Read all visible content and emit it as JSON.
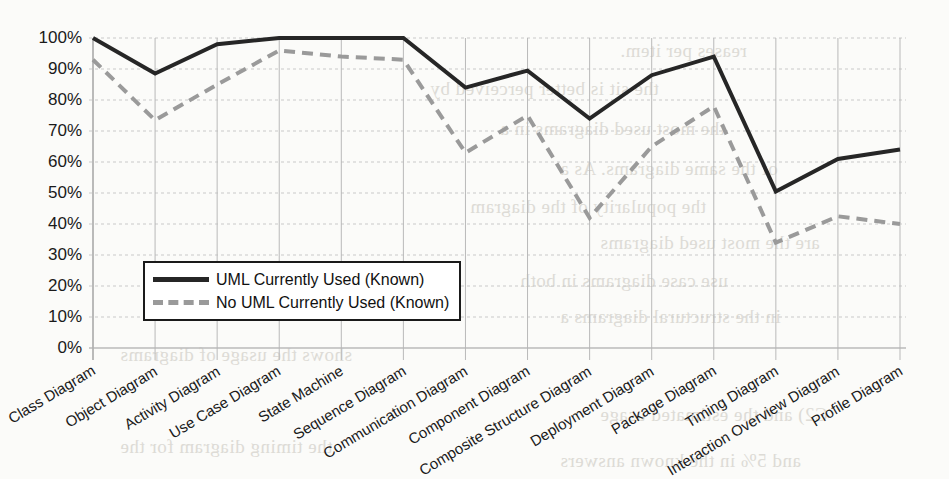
{
  "chart_data": {
    "type": "line",
    "title": "",
    "xlabel": "",
    "ylabel": "",
    "ylim": [
      0,
      100
    ],
    "grid": true,
    "legend_position": "inside-lower-left",
    "ytick_labels": [
      "100%",
      "90%",
      "80%",
      "70%",
      "60%",
      "50%",
      "40%",
      "30%",
      "20%",
      "10%",
      "0%"
    ],
    "ytick_values": [
      100,
      90,
      80,
      70,
      60,
      50,
      40,
      30,
      20,
      10,
      0
    ],
    "categories": [
      "Class Diagram",
      "Object Diagram",
      "Activity Diagram",
      "Use Case Diagram",
      "State Machine",
      "Sequence Diagram",
      "Communication Diagram",
      "Component Diagram",
      "Composite Structure Diagram",
      "Deployment Diagram",
      "Package Diagram",
      "Timing Diagram",
      "Interaction Overview Diagram",
      "Profile Diagram"
    ],
    "series": [
      {
        "name": "UML Currently Used  (Known)",
        "style": "solid",
        "color": "#262626",
        "values": [
          100,
          88.5,
          98,
          100,
          100,
          100,
          84,
          89.5,
          74,
          88,
          94,
          50.5,
          61,
          64
        ]
      },
      {
        "name": "No UML Currently Used  (Known)",
        "style": "dashed",
        "color": "#9a9a9a",
        "values": [
          93,
          73.5,
          85,
          96,
          94,
          93,
          63,
          75,
          42,
          65,
          78,
          34,
          42.5,
          40
        ]
      }
    ]
  },
  "legend": {
    "items": [
      {
        "label": "UML Currently Used  (Known)",
        "style": "solid"
      },
      {
        "label": "No UML Currently Used  (Known)",
        "style": "dashed"
      }
    ]
  },
  "background_text": {
    "lines": [
      "reases per item.",
      "the sit is better perceived by",
      "the most used diagrams in a",
      "of the same diagrams. As a",
      "the popularity of the diagram",
      "are the most used diagrams",
      "use case diagrams in both",
      "in the structural diagrams a",
      "shows the usage of diagrams",
      "C2) and the estimated usage",
      "the timing diagram for the",
      "and 5% in the known answers"
    ]
  }
}
